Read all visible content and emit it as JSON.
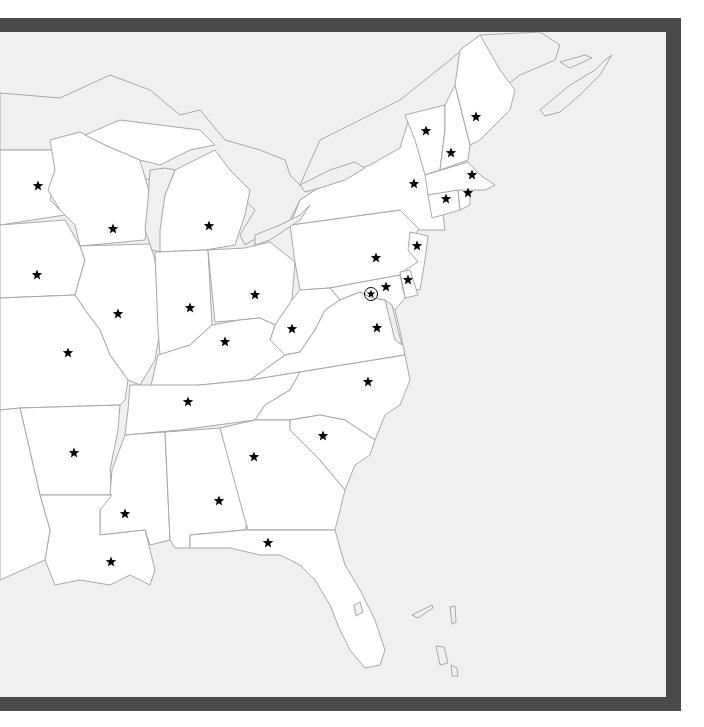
{
  "map": {
    "type": "outline-map",
    "region": "Eastern United States",
    "frame_color": "#4a4a4a",
    "water_color": "#f0f0f0",
    "land_color": "#ffffff",
    "border_color": "#a8a8a8",
    "capital_marker": "star",
    "capitals": [
      {
        "state": "MN",
        "x": 38,
        "y": 186
      },
      {
        "state": "WI",
        "x": 113,
        "y": 229
      },
      {
        "state": "MI",
        "x": 209,
        "y": 226
      },
      {
        "state": "IA",
        "x": 37,
        "y": 275
      },
      {
        "state": "IL",
        "x": 118,
        "y": 314
      },
      {
        "state": "IN",
        "x": 190,
        "y": 308
      },
      {
        "state": "OH",
        "x": 255,
        "y": 295
      },
      {
        "state": "WV",
        "x": 292,
        "y": 329
      },
      {
        "state": "KY",
        "x": 225,
        "y": 342
      },
      {
        "state": "MO",
        "x": 68,
        "y": 353
      },
      {
        "state": "TN",
        "x": 188,
        "y": 402
      },
      {
        "state": "AR",
        "x": 74,
        "y": 453
      },
      {
        "state": "MS",
        "x": 125,
        "y": 514
      },
      {
        "state": "AL",
        "x": 219,
        "y": 501
      },
      {
        "state": "GA",
        "x": 254,
        "y": 457
      },
      {
        "state": "SC",
        "x": 323,
        "y": 436
      },
      {
        "state": "NC",
        "x": 368,
        "y": 382
      },
      {
        "state": "VA",
        "x": 377,
        "y": 328
      },
      {
        "state": "MD",
        "x": 386,
        "y": 287
      },
      {
        "state": "DE",
        "x": 408,
        "y": 280
      },
      {
        "state": "NJ",
        "x": 417,
        "y": 246
      },
      {
        "state": "PA",
        "x": 376,
        "y": 258
      },
      {
        "state": "NY",
        "x": 414,
        "y": 184
      },
      {
        "state": "VT",
        "x": 426,
        "y": 131
      },
      {
        "state": "NH",
        "x": 451,
        "y": 153
      },
      {
        "state": "ME",
        "x": 476,
        "y": 117
      },
      {
        "state": "MA",
        "x": 472,
        "y": 175
      },
      {
        "state": "RI",
        "x": 468,
        "y": 193
      },
      {
        "state": "CT",
        "x": 446,
        "y": 199
      },
      {
        "state": "LA",
        "x": 111,
        "y": 562
      },
      {
        "state": "FL",
        "x": 268,
        "y": 543
      }
    ],
    "national_capital": {
      "name": "DC",
      "x": 371,
      "y": 294,
      "marker": "circled-star"
    }
  }
}
